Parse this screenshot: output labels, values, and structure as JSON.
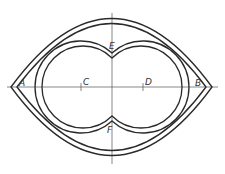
{
  "diagram": {
    "type": "technical drawing",
    "colors": {
      "line": "#2a2a2a",
      "centerline": "#555555",
      "background": "#ffffff"
    },
    "labels": {
      "A": "A",
      "B": "B",
      "C": "C",
      "D": "D",
      "E": "E",
      "F": "F"
    },
    "points": [
      {
        "id": "A",
        "role": "left tip of lens on horizontal axis"
      },
      {
        "id": "B",
        "role": "right tip of lens on horizontal axis"
      },
      {
        "id": "C",
        "role": "center of left circle"
      },
      {
        "id": "D",
        "role": "center of right circle"
      },
      {
        "id": "E",
        "role": "upper cusp where circles meet"
      },
      {
        "id": "F",
        "role": "lower cusp where circles meet"
      }
    ]
  }
}
